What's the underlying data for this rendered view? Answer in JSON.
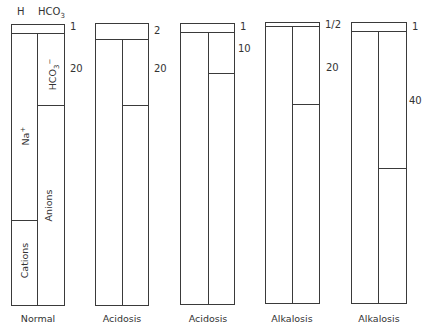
{
  "header": {
    "h_label": "H",
    "hco3_label": "HCO",
    "hco3_sub": "3"
  },
  "panels": [
    {
      "label": "Normal",
      "h_ratio": "1",
      "hco3_ratio": "20",
      "inner_labels": {
        "hco3": "HCO",
        "hco3_sub": "3",
        "hco3_sup": "−",
        "na": "Na",
        "na_sup": "+",
        "anions": "Anions",
        "cations": "Cations"
      }
    },
    {
      "label": "Acidosis",
      "h_ratio": "2",
      "hco3_ratio": "20"
    },
    {
      "label": "Acidosis",
      "h_ratio": "1",
      "hco3_ratio": "10"
    },
    {
      "label": "Alkalosis",
      "h_ratio": "1/2",
      "hco3_ratio": "20"
    },
    {
      "label": "Alkalosis",
      "h_ratio": "1",
      "hco3_ratio": "40"
    }
  ],
  "colors": {
    "line": "#3a3a3a",
    "text": "#333333",
    "background": "#ffffff"
  }
}
